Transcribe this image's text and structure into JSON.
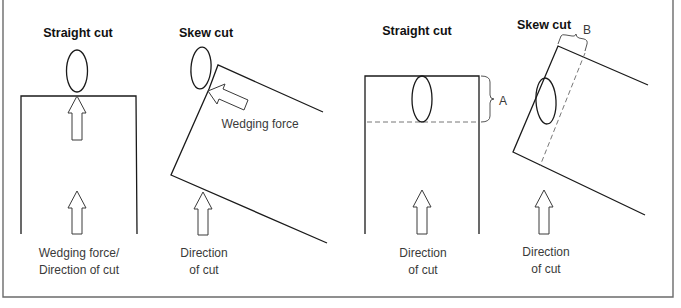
{
  "figure": {
    "frame_color": "#6b6b6b",
    "panels": [
      {
        "id": "straight-cut-1",
        "title": "Straight cut",
        "labels": [
          "Wedging force/",
          "Direction of cut"
        ]
      },
      {
        "id": "skew-cut-1",
        "title": "Skew cut",
        "annotation": "Wedging force",
        "labels": [
          "Direction",
          "of cut"
        ]
      },
      {
        "id": "straight-cut-2",
        "title": "Straight cut",
        "dimension_label": "A",
        "labels": [
          "Direction",
          "of cut"
        ]
      },
      {
        "id": "skew-cut-2",
        "title": "Skew cut",
        "dimension_label": "B",
        "labels": [
          "Direction",
          "of cut"
        ]
      }
    ]
  }
}
